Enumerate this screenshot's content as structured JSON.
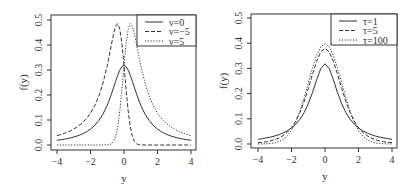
{
  "chart_data": [
    {
      "type": "line",
      "panel": "left",
      "title": "",
      "xlabel": "y",
      "ylabel": "f(y)",
      "xlim": [
        -4,
        4
      ],
      "ylim": [
        0,
        0.5
      ],
      "xticks": [
        "-4",
        "-2",
        "0",
        "2",
        "4"
      ],
      "yticks": [
        "0.0",
        "0.1",
        "0.2",
        "0.3",
        "0.4",
        "0.5"
      ],
      "grid": false,
      "legend_position": "top-right",
      "x": [
        -4,
        -3.75,
        -3.5,
        -3.25,
        -3,
        -2.75,
        -2.5,
        -2.25,
        -2,
        -1.75,
        -1.5,
        -1.25,
        -1,
        -0.875,
        -0.75,
        -0.625,
        -0.5,
        -0.375,
        -0.25,
        -0.125,
        0,
        0.125,
        0.25,
        0.375,
        0.5,
        0.625,
        0.75,
        0.875,
        1,
        1.25,
        1.5,
        1.75,
        2,
        2.25,
        2.5,
        2.75,
        3,
        3.25,
        3.5,
        3.75,
        4
      ],
      "series": [
        {
          "name": "ν=0",
          "style": "solid",
          "values": [
            0.0187,
            0.0212,
            0.0242,
            0.0275,
            0.0318,
            0.0372,
            0.0439,
            0.0524,
            0.0637,
            0.0784,
            0.0979,
            0.1242,
            0.1592,
            0.1803,
            0.2037,
            0.2289,
            0.2546,
            0.2791,
            0.2996,
            0.3134,
            0.3183,
            0.3134,
            0.2996,
            0.2791,
            0.2546,
            0.2289,
            0.2037,
            0.1803,
            0.1592,
            0.1242,
            0.0979,
            0.0784,
            0.0637,
            0.0524,
            0.0439,
            0.0372,
            0.0318,
            0.0275,
            0.0242,
            0.0212,
            0.0187
          ]
        },
        {
          "name": "ν=−5",
          "style": "dashed",
          "values": [
            0.0374,
            0.0423,
            0.0485,
            0.055,
            0.0637,
            0.0744,
            0.0878,
            0.1047,
            0.1273,
            0.1568,
            0.1959,
            0.2484,
            0.3179,
            0.359,
            0.4025,
            0.4439,
            0.4753,
            0.4854,
            0.4634,
            0.4051,
            0.3183,
            0.2218,
            0.1358,
            0.0727,
            0.034,
            0.0139,
            0.005,
            0.0016,
            0.0004,
            0.0,
            0.0,
            0.0,
            0.0,
            0.0,
            0.0,
            0.0,
            0.0,
            0.0,
            0.0,
            0.0,
            0.0
          ]
        },
        {
          "name": "ν=5",
          "style": "dotted",
          "values": [
            0.0,
            0.0,
            0.0,
            0.0,
            0.0,
            0.0,
            0.0,
            0.0,
            0.0,
            0.0,
            0.0,
            0.0,
            0.0004,
            0.0016,
            0.005,
            0.0139,
            0.034,
            0.0727,
            0.1358,
            0.2218,
            0.3183,
            0.4051,
            0.4634,
            0.4854,
            0.4753,
            0.4439,
            0.4025,
            0.359,
            0.3179,
            0.2484,
            0.1959,
            0.1568,
            0.1273,
            0.1047,
            0.0878,
            0.0744,
            0.0637,
            0.055,
            0.0485,
            0.0423,
            0.0374
          ]
        }
      ]
    },
    {
      "type": "line",
      "panel": "right",
      "title": "",
      "xlabel": "y",
      "ylabel": "f(y)",
      "xlim": [
        -4,
        4
      ],
      "ylim": [
        0,
        0.5
      ],
      "xticks": [
        "-4",
        "-2",
        "0",
        "2",
        "4"
      ],
      "yticks": [
        "0.0",
        "0.1",
        "0.2",
        "0.3",
        "0.4",
        "0.5"
      ],
      "grid": false,
      "legend_position": "top-right",
      "x": [
        -4,
        -3.75,
        -3.5,
        -3.25,
        -3,
        -2.75,
        -2.5,
        -2.25,
        -2,
        -1.75,
        -1.5,
        -1.25,
        -1,
        -0.75,
        -0.5,
        -0.25,
        0,
        0.25,
        0.5,
        0.75,
        1,
        1.25,
        1.5,
        1.75,
        2,
        2.25,
        2.5,
        2.75,
        3,
        3.25,
        3.5,
        3.75,
        4
      ],
      "series": [
        {
          "name": "τ=1",
          "style": "solid",
          "values": [
            0.0187,
            0.0212,
            0.0242,
            0.0275,
            0.0318,
            0.0372,
            0.0439,
            0.0524,
            0.0637,
            0.0784,
            0.0979,
            0.1242,
            0.1592,
            0.2037,
            0.2546,
            0.2996,
            0.3183,
            0.2996,
            0.2546,
            0.2037,
            0.1592,
            0.1242,
            0.0979,
            0.0784,
            0.0637,
            0.0524,
            0.0439,
            0.0372,
            0.0318,
            0.0275,
            0.0242,
            0.0212,
            0.0187
          ]
        },
        {
          "name": "τ=5",
          "style": "dashed",
          "values": [
            0.0051,
            0.0069,
            0.0092,
            0.0126,
            0.0173,
            0.0239,
            0.0333,
            0.0466,
            0.0651,
            0.0905,
            0.1245,
            0.1679,
            0.2197,
            0.2757,
            0.3279,
            0.3657,
            0.3796,
            0.3657,
            0.3279,
            0.2757,
            0.2197,
            0.1679,
            0.1245,
            0.0905,
            0.0651,
            0.0466,
            0.0333,
            0.0239,
            0.0173,
            0.0126,
            0.0092,
            0.0069,
            0.0051
          ]
        },
        {
          "name": "τ=100",
          "style": "dotted",
          "values": [
            0.0002,
            0.0004,
            0.0009,
            0.002,
            0.0045,
            0.0092,
            0.0177,
            0.032,
            0.0544,
            0.0866,
            0.1297,
            0.1827,
            0.242,
            0.301,
            0.3518,
            0.3862,
            0.3984,
            0.3862,
            0.3518,
            0.301,
            0.242,
            0.1827,
            0.1297,
            0.0866,
            0.0544,
            0.032,
            0.0177,
            0.0092,
            0.0045,
            0.002,
            0.0009,
            0.0004,
            0.0002
          ]
        }
      ]
    }
  ],
  "layout": {
    "panels": [
      {
        "box": [
          51,
          15,
          196,
          150
        ],
        "x0px": 57,
        "x1px": 191,
        "y0px": 145,
        "y1px": 20,
        "legend": [
          137,
          15,
          196,
          46
        ]
      },
      {
        "box": [
          251,
          14,
          397,
          148
        ],
        "x0px": 258,
        "x1px": 392,
        "y0px": 144,
        "y1px": 18,
        "legend": [
          331,
          14,
          397,
          45
        ]
      }
    ]
  }
}
